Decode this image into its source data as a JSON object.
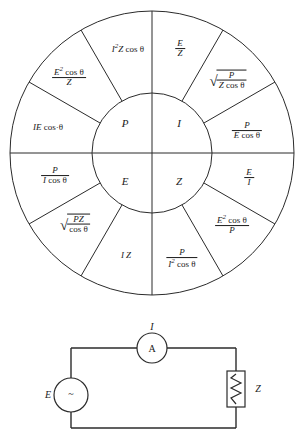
{
  "wheel": {
    "center_quadrants": [
      {
        "id": "power",
        "label": "P",
        "position": "top-left"
      },
      {
        "id": "current",
        "label": "I",
        "position": "top-right"
      },
      {
        "id": "voltage",
        "label": "E",
        "position": "bottom-left"
      },
      {
        "id": "impedance",
        "label": "Z",
        "position": "bottom-right"
      }
    ],
    "sectors": [
      {
        "id": "p-1",
        "group": "P",
        "formula_text": "I²Z cos θ",
        "kind": "plain"
      },
      {
        "id": "p-2",
        "group": "P",
        "formula_text": "E² cos θ / Z",
        "kind": "fraction",
        "numerator": "E² cos θ",
        "denominator": "Z"
      },
      {
        "id": "p-3",
        "group": "P",
        "formula_text": "IE cos θ",
        "kind": "plain"
      },
      {
        "id": "i-1",
        "group": "I",
        "formula_text": "E / Z",
        "kind": "fraction",
        "numerator": "E",
        "denominator": "Z"
      },
      {
        "id": "i-2",
        "group": "I",
        "formula_text": "√( P / (Z cos θ) )",
        "kind": "radical-fraction",
        "numerator": "P",
        "denominator": "Z cos θ"
      },
      {
        "id": "i-3",
        "group": "I",
        "formula_text": "P / (E cos θ)",
        "kind": "fraction",
        "numerator": "P",
        "denominator": "E cos θ"
      },
      {
        "id": "e-1",
        "group": "E",
        "formula_text": "P / (I cos θ)",
        "kind": "fraction",
        "numerator": "P",
        "denominator": "I cos θ"
      },
      {
        "id": "e-2",
        "group": "E",
        "formula_text": "√( PZ / cos θ )",
        "kind": "radical-fraction",
        "numerator": "PZ",
        "denominator": "cos θ"
      },
      {
        "id": "e-3",
        "group": "E",
        "formula_text": "IZ",
        "kind": "plain"
      },
      {
        "id": "z-1",
        "group": "Z",
        "formula_text": "P / (I² cos θ)",
        "kind": "fraction",
        "numerator": "P",
        "denominator": "I² cos θ"
      },
      {
        "id": "z-2",
        "group": "Z",
        "formula_text": "E² cos θ / P",
        "kind": "fraction",
        "numerator": "E² cos θ",
        "denominator": "P"
      },
      {
        "id": "z-3",
        "group": "Z",
        "formula_text": "E / I",
        "kind": "fraction",
        "numerator": "E",
        "denominator": "I"
      }
    ]
  },
  "circuit": {
    "source": {
      "label": "E",
      "symbol": "~",
      "type": "ac-source"
    },
    "meter": {
      "label": "I",
      "symbol": "A",
      "type": "ammeter"
    },
    "load": {
      "label": "Z",
      "type": "impedance"
    }
  },
  "colors": {
    "ink": "#1a1a1a",
    "line": "#2b2b2b",
    "background": "#ffffff"
  }
}
